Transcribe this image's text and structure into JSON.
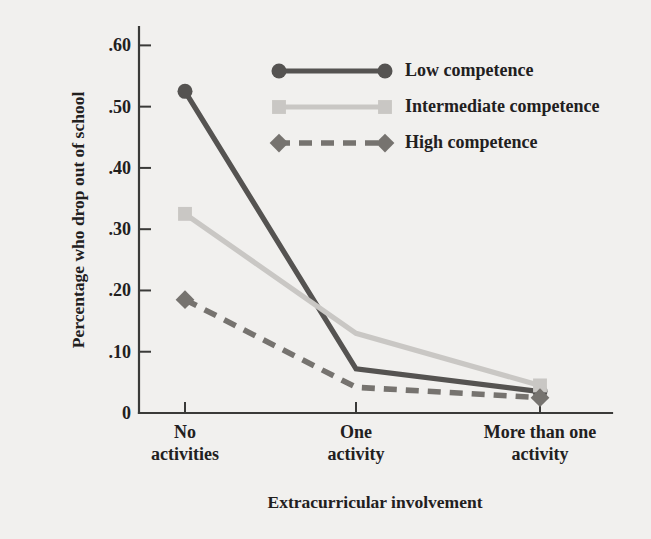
{
  "chart_data": {
    "type": "line",
    "title": "",
    "xlabel": "Extracurricular involvement",
    "ylabel": "Percentage who drop out of school",
    "categories": [
      "No activities",
      "One activity",
      "More than one activity"
    ],
    "category_lines": [
      [
        "No",
        "activities"
      ],
      [
        "One",
        "activity"
      ],
      [
        "More than one",
        "activity"
      ]
    ],
    "ylim": [
      0,
      0.63
    ],
    "yticks": [
      0,
      0.1,
      0.2,
      0.3,
      0.4,
      0.5,
      0.6
    ],
    "ytick_labels": [
      "0",
      ".10",
      ".20",
      ".30",
      ".40",
      ".50",
      ".60"
    ],
    "grid": false,
    "legend_position": "top-right",
    "series": [
      {
        "name": "Low competence",
        "values": [
          0.525,
          0.072,
          0.035
        ],
        "color": "#555351",
        "marker": "circle",
        "dash": "solid"
      },
      {
        "name": "Intermediate competence",
        "values": [
          0.325,
          0.13,
          0.045
        ],
        "color": "#c9c7c4",
        "marker": "square",
        "dash": "solid"
      },
      {
        "name": "High competence",
        "values": [
          0.185,
          0.042,
          0.025
        ],
        "color": "#76736f",
        "marker": "diamond",
        "dash": "dashed"
      }
    ]
  },
  "figure": {
    "background_color": "#f1f0ee",
    "axis_color": "#3a3a38"
  }
}
